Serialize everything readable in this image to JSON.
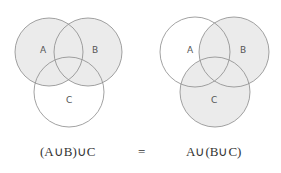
{
  "left_diagram": {
    "labels": {
      "a": "A",
      "b": "B",
      "c": "C"
    },
    "shaded": [
      "A",
      "B"
    ],
    "expression": "(A∪B)∪C"
  },
  "right_diagram": {
    "labels": {
      "a": "A",
      "b": "B",
      "c": "C"
    },
    "shaded": [
      "B",
      "C"
    ],
    "expression": "A∪(B∪C)"
  },
  "equals": "=",
  "colors": {
    "shade": "#ebebeb",
    "stroke": "#8a8a8a"
  }
}
